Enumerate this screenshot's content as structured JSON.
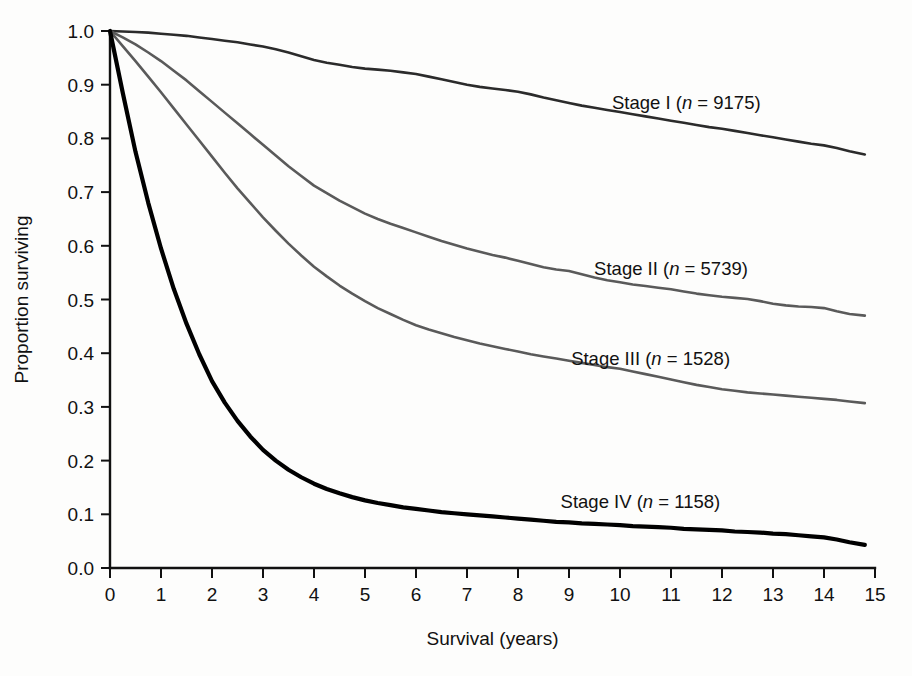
{
  "figure": {
    "background_color": "#fdfdfc",
    "axis_color": "#111111"
  },
  "chart_data": {
    "type": "line",
    "title": "",
    "subtitle": "",
    "xlabel": "Survival (years)",
    "ylabel": "Proportion surviving",
    "xlim": [
      0,
      15
    ],
    "ylim": [
      0,
      1.0
    ],
    "grid": false,
    "legend_position": "inline-right-of-curve",
    "xticks": [
      0,
      1,
      2,
      3,
      4,
      5,
      6,
      7,
      8,
      9,
      10,
      11,
      12,
      13,
      14,
      15
    ],
    "xtick_labels": [
      "0",
      "1",
      "2",
      "3",
      "4",
      "5",
      "6",
      "7",
      "8",
      "9",
      "10",
      "11",
      "12",
      "13",
      "14",
      "15"
    ],
    "yticks": [
      0.0,
      0.1,
      0.2,
      0.3,
      0.4,
      0.5,
      0.6,
      0.7,
      0.8,
      0.9,
      1.0
    ],
    "ytick_labels": [
      "0.0",
      "0.1",
      "0.2",
      "0.3",
      "0.4",
      "0.5",
      "0.6",
      "0.7",
      "0.8",
      "0.9",
      "1.0"
    ],
    "x": [
      0,
      0.25,
      0.5,
      0.75,
      1,
      1.25,
      1.5,
      1.75,
      2,
      2.25,
      2.5,
      2.75,
      3,
      3.25,
      3.5,
      3.75,
      4,
      4.25,
      4.5,
      4.75,
      5,
      5.25,
      5.5,
      5.75,
      6,
      6.25,
      6.5,
      6.75,
      7,
      7.25,
      7.5,
      7.75,
      8,
      8.25,
      8.5,
      8.75,
      9,
      9.25,
      9.5,
      9.75,
      10,
      10.25,
      10.5,
      10.75,
      11,
      11.25,
      11.5,
      11.75,
      12,
      12.25,
      12.5,
      12.75,
      13,
      13.25,
      13.5,
      13.75,
      14,
      14.25,
      14.5,
      14.8
    ],
    "series": [
      {
        "name": "Stage I",
        "n": 9175,
        "label": "Stage I (n = 9175)",
        "label_prefix": "Stage I (",
        "label_italic": "n",
        "label_suffix": " = 9175)",
        "color": "#2b2b2b",
        "linewidth": 2.6,
        "label_x": 11.3,
        "label_y": 0.855,
        "values": [
          1.0,
          0.999,
          0.998,
          0.997,
          0.995,
          0.993,
          0.991,
          0.988,
          0.985,
          0.982,
          0.979,
          0.975,
          0.971,
          0.966,
          0.96,
          0.953,
          0.946,
          0.941,
          0.937,
          0.933,
          0.93,
          0.928,
          0.926,
          0.923,
          0.92,
          0.915,
          0.91,
          0.905,
          0.9,
          0.896,
          0.893,
          0.89,
          0.887,
          0.882,
          0.876,
          0.871,
          0.866,
          0.861,
          0.857,
          0.853,
          0.849,
          0.845,
          0.841,
          0.837,
          0.833,
          0.829,
          0.825,
          0.821,
          0.818,
          0.814,
          0.81,
          0.806,
          0.802,
          0.798,
          0.794,
          0.79,
          0.787,
          0.782,
          0.776,
          0.77
        ]
      },
      {
        "name": "Stage II",
        "n": 5739,
        "label": "Stage II (n = 5739)",
        "label_prefix": "Stage II (",
        "label_italic": "n",
        "label_suffix": " = 5739)",
        "color": "#5a5a5a",
        "linewidth": 2.6,
        "label_x": 11.0,
        "label_y": 0.545,
        "values": [
          1.0,
          0.988,
          0.975,
          0.96,
          0.944,
          0.926,
          0.908,
          0.888,
          0.868,
          0.848,
          0.828,
          0.808,
          0.788,
          0.768,
          0.748,
          0.73,
          0.712,
          0.698,
          0.684,
          0.672,
          0.66,
          0.65,
          0.641,
          0.633,
          0.625,
          0.617,
          0.609,
          0.602,
          0.595,
          0.589,
          0.583,
          0.578,
          0.572,
          0.566,
          0.56,
          0.556,
          0.553,
          0.547,
          0.541,
          0.536,
          0.532,
          0.528,
          0.525,
          0.522,
          0.519,
          0.515,
          0.511,
          0.508,
          0.505,
          0.503,
          0.501,
          0.497,
          0.492,
          0.489,
          0.487,
          0.486,
          0.484,
          0.478,
          0.473,
          0.47
        ]
      },
      {
        "name": "Stage III",
        "n": 1528,
        "label": "Stage III (n = 1528)",
        "label_prefix": "Stage III (",
        "label_italic": "n",
        "label_suffix": " = 1528)",
        "color": "#5a5a5a",
        "linewidth": 2.6,
        "label_x": 10.6,
        "label_y": 0.378,
        "values": [
          1.0,
          0.972,
          0.944,
          0.915,
          0.886,
          0.856,
          0.826,
          0.796,
          0.766,
          0.736,
          0.707,
          0.68,
          0.653,
          0.628,
          0.604,
          0.582,
          0.561,
          0.543,
          0.526,
          0.511,
          0.497,
          0.484,
          0.473,
          0.462,
          0.452,
          0.444,
          0.437,
          0.43,
          0.424,
          0.418,
          0.413,
          0.408,
          0.403,
          0.398,
          0.394,
          0.39,
          0.386,
          0.382,
          0.378,
          0.374,
          0.371,
          0.366,
          0.361,
          0.356,
          0.351,
          0.346,
          0.341,
          0.337,
          0.333,
          0.33,
          0.327,
          0.325,
          0.323,
          0.321,
          0.319,
          0.317,
          0.315,
          0.313,
          0.31,
          0.307
        ]
      },
      {
        "name": "Stage IV",
        "n": 1158,
        "label": "Stage IV (n = 1158)",
        "label_prefix": "Stage IV (",
        "label_italic": "n",
        "label_suffix": " = 1158)",
        "color": "#000000",
        "linewidth": 4.2,
        "label_x": 10.4,
        "label_y": 0.112,
        "values": [
          1.0,
          0.885,
          0.775,
          0.68,
          0.595,
          0.52,
          0.455,
          0.398,
          0.348,
          0.308,
          0.274,
          0.245,
          0.22,
          0.2,
          0.183,
          0.169,
          0.157,
          0.147,
          0.139,
          0.132,
          0.126,
          0.121,
          0.117,
          0.113,
          0.11,
          0.107,
          0.104,
          0.102,
          0.1,
          0.098,
          0.096,
          0.094,
          0.092,
          0.09,
          0.088,
          0.086,
          0.085,
          0.083,
          0.082,
          0.081,
          0.08,
          0.078,
          0.077,
          0.076,
          0.075,
          0.073,
          0.072,
          0.071,
          0.07,
          0.068,
          0.067,
          0.066,
          0.064,
          0.063,
          0.061,
          0.059,
          0.057,
          0.053,
          0.048,
          0.043
        ]
      }
    ]
  }
}
